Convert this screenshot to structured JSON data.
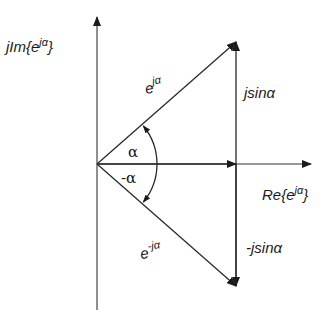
{
  "diagram": {
    "type": "phasor-diagram",
    "axes": {
      "imaginary_label": {
        "prefix": "jIm{e",
        "sup": "jα",
        "suffix": "}"
      },
      "real_label": {
        "prefix": "Re{e",
        "sup": "jα",
        "suffix": "}"
      }
    },
    "vectors": {
      "positive": {
        "base": "e",
        "sup": "jα"
      },
      "negative": {
        "base": "e",
        "sup": "-jα"
      }
    },
    "components": {
      "positive_imag": "jsinα",
      "negative_imag": "-jsinα"
    },
    "angles": {
      "positive": "α",
      "negative": "-α"
    },
    "angle_deg": 41,
    "colors": {
      "ink": "#1a1a1a",
      "background": "#ffffff"
    }
  }
}
